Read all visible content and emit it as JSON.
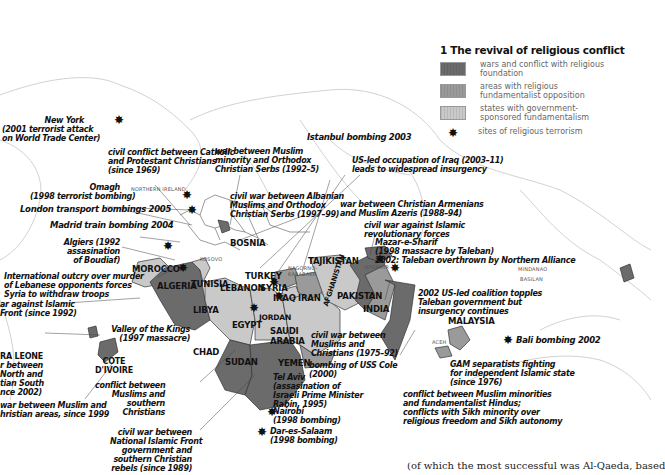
{
  "legend": {
    "title": "1 The revival of religious conflict",
    "items": [
      {
        "label": "wars and conflict with religious\nfoundation",
        "color": "#6b6b6b",
        "icon": "swatch"
      },
      {
        "label": "areas with religious\nfundamentalist opposition",
        "color": "#9a9a9a",
        "icon": "swatch"
      },
      {
        "label": "states with government-\nsponsored fundamentalism",
        "color": "#c9c9c9",
        "icon": "swatch"
      },
      {
        "label": "sites of religious terrorism",
        "color": "#111111",
        "icon": "starburst-icon"
      }
    ]
  },
  "countries": {
    "bosnia": "BOSNIA",
    "kosovo": "KOSOVO",
    "northern_ireland": "NORTHERN IRELAND",
    "morocco": "MOROCCO",
    "algeria": "ALGERIA",
    "tunisia": "TUNISIA",
    "libya": "LIBYA",
    "egypt": "EGYPT",
    "chad": "CHAD",
    "sudan": "SUDAN",
    "turkey": "TURKEY",
    "lebanon": "LEBANON",
    "syria": "SYRIA",
    "iraq": "IRAQ",
    "iran": "IRAN",
    "jordan": "JORDAN",
    "saudi_arabia": "SAUDI\nARABIA",
    "yemen": "YEMEN",
    "nagorno": "NAGORNO-\nKARABAKH",
    "tajikistan": "TAJIKISTAN",
    "afghanistan": "AFGHANISTAN",
    "pakistan": "PAKISTAN",
    "india": "INDIA",
    "kashmir": "KASHMIR",
    "malaysia": "MALAYSIA",
    "mindanao": "MINDANAO",
    "basilan": "BASILAN",
    "aceh": "ACEH",
    "cote_divoire": "COTE\nD'IVOIRE",
    "sierra_leone": "RA LEONE"
  },
  "annotations": {
    "new_york": "New York\n(2001 terrorist attack\non World Trade Center)",
    "n_ireland": "civil conflict between Catholic\nand Protestant Christians\n(since 1969)",
    "bosnia_war": "war between Muslim\nminority and Orthodox\nChristian Serbs (1992–5)",
    "istanbul": "Istanbul bombing 2003",
    "iraq": "US-led occupation of Iraq (2003–11)\nleads to widespread insurgency",
    "omagh": "Omagh\n(1998 terrorist bombing)",
    "kosovo_war": "civil war between Albanian\nMuslims and Orthodox\nChristian Serbs (1997–99)",
    "armenia": "war between Christian Armenians\nand Muslim Azeris (1988–94)",
    "london": "London transport bombings 2005",
    "madrid": "Madrid train bombing 2004",
    "tajik": "civil war against Islamic\nrevolutionary forces",
    "mazar": "Mazar-e-Sharif\n(1998 massacre by Taleban)\n2002: Taleban overthrown by Northern Alliance",
    "algiers": "Algiers (1992\nassasination\nof Boudiaf)",
    "lebanon_outcry": "International outcry over murder\nof Lebanese opponents forces\nSyria to withdraw troops",
    "algeria_war": "ar against Islamic\nFront (since 1992)",
    "afghan_2002": "2002 US-led coalition topples\nTaleban government but\ninsurgency continues",
    "valley": "Valley of the Kings\n(1997 massacre)",
    "lebanon_war": "civil war between\nMuslims and\nChristians (1975–92)",
    "sierra": "r between\nNorth and\ntian South\nnce 2002)",
    "uss_cole": "bombing of USS Cole\n(2000)",
    "bali": "Bali bombing 2002",
    "tel_aviv": "Tel Aviv\n(assasination of\nIsraeli Prime Minister\nRabin, 1995)",
    "chad": "conflict between\nMuslims and\nsouthern\nChristians",
    "gam": "GAM separatists fighting\nfor independent Islamic state\n(since 1976)",
    "cote": "war between Muslim and\nhristian areas, since 1999",
    "india": "conflict between Muslim minorities\nand fundamentalist Hindus;\nconflicts with Sikh minority over\nreligious freedom and Sikh autonomy",
    "nairobi": "Nairobi\n(1998 bombing)",
    "dar": "Dar-es-Salaam\n(1998 bombing)",
    "sudan": "civil war between\nNational Islamic Front\ngovernment and\nsouthern Christian\nrebels (since 1989)"
  },
  "caption": "(of which the most successful was Al-Qaeda, based",
  "colors": {
    "war": "#6b6b6b",
    "opposition": "#9a9a9a",
    "state": "#c9c9c9",
    "outline": "#b5b5b5",
    "border": "#333333"
  }
}
